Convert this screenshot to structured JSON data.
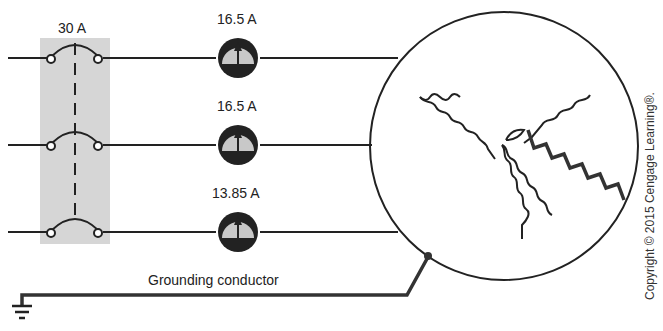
{
  "breaker": {
    "label": "30 A",
    "fill": "#d6d6d6"
  },
  "ammeters": [
    {
      "label": "16.5 A",
      "y": 58
    },
    {
      "label": "16.5 A",
      "y": 145
    },
    {
      "label": "13.85 A",
      "y": 232
    }
  ],
  "ground": {
    "label": "Grounding conductor"
  },
  "motor": {
    "type": "wye-connected three-phase motor",
    "faulty_winding": "shorted to frame"
  },
  "copyright": "Copyright © 2015 Cengage Learning®.",
  "colors": {
    "line": "#222222",
    "meter_face": "#c8c8c8",
    "shade": "#d6d6d6"
  }
}
